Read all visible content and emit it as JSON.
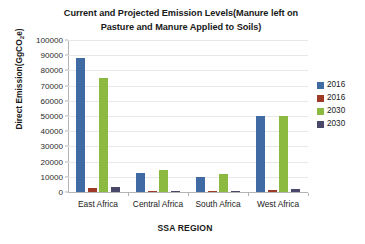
{
  "chart_data": {
    "type": "bar",
    "title": "Current and Projected Emission Levels(Manure left on Pasture and Manure Applied to Soils)",
    "title_lines": [
      "Current and Projected Emission Levels(Manure left on",
      "Pasture and Manure Applied to Soils)"
    ],
    "xlabel": "SSA REGION",
    "ylabel": "Direct Emission(GgCO₂e)",
    "ylabel_prefix": "Direct Emission(GgCO",
    "ylabel_sub": "2",
    "ylabel_suffix": "e)",
    "categories": [
      "East Africa",
      "Central Africa",
      "South Africa",
      "West Africa"
    ],
    "ylim": [
      0,
      100000
    ],
    "ytick_step": 10000,
    "yticks": [
      0,
      10000,
      20000,
      30000,
      40000,
      50000,
      60000,
      70000,
      80000,
      90000,
      100000
    ],
    "ytick_labels": [
      "0",
      "10000",
      "20000",
      "30000",
      "40000",
      "50000",
      "60000",
      "70000",
      "80000",
      "90000",
      "100000"
    ],
    "grid": true,
    "legend_position": "right",
    "series": [
      {
        "name": "2016",
        "legend_label": "2016",
        "color": "#3f6aa3",
        "values": [
          88000,
          12500,
          10000,
          50000
        ]
      },
      {
        "name": "2016",
        "legend_label": "2016",
        "color": "#9e3a26",
        "values": [
          2800,
          350,
          150,
          1300
        ]
      },
      {
        "name": "2030",
        "legend_label": "2030",
        "color": "#8cb93f",
        "values": [
          75000,
          14500,
          12000,
          50000
        ]
      },
      {
        "name": "2030",
        "legend_label": "2030",
        "color": "#49486b",
        "values": [
          3300,
          450,
          200,
          1700
        ]
      }
    ]
  },
  "colors": {
    "series_2016_a": "#3f6aa3",
    "series_2016_b": "#9e3a26",
    "series_2030_a": "#8cb93f",
    "series_2030_b": "#49486b",
    "grid": "#e8e8e8",
    "axis": "#b4b4b4",
    "text": "#1a1a1a",
    "background": "#ffffff"
  }
}
